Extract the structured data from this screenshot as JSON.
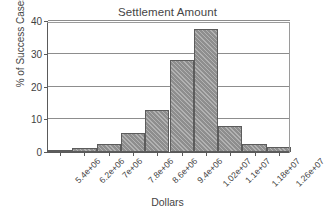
{
  "chart_data": {
    "type": "bar",
    "title": "Settlement Amount",
    "xlabel": "Dollars",
    "ylabel": "% of Success Cases",
    "categories": [
      "5.4e+06",
      "6.2e+06",
      "7e+06",
      "7.8e+06",
      "8.6e+06",
      "9.4e+06",
      "1.02e+07",
      "1.1e+07",
      "1.18e+07",
      "1.26e+07"
    ],
    "values": [
      0.7,
      1.1,
      2.3,
      5.7,
      12.7,
      28.2,
      37.5,
      7.9,
      2.3,
      1.4
    ],
    "ylim": [
      0,
      40
    ],
    "yticks": [
      0,
      10,
      20,
      30,
      40
    ],
    "ytick_labels": [
      "0",
      "10",
      "20",
      "30",
      "40"
    ],
    "grid": true,
    "legend": null,
    "bar_color": "#8e8e8e",
    "bar_edge_color": "#5c5c5c",
    "axis_color": "#5a5a5a",
    "grid_color": "#8d8d8d",
    "background": "#ffffff"
  }
}
